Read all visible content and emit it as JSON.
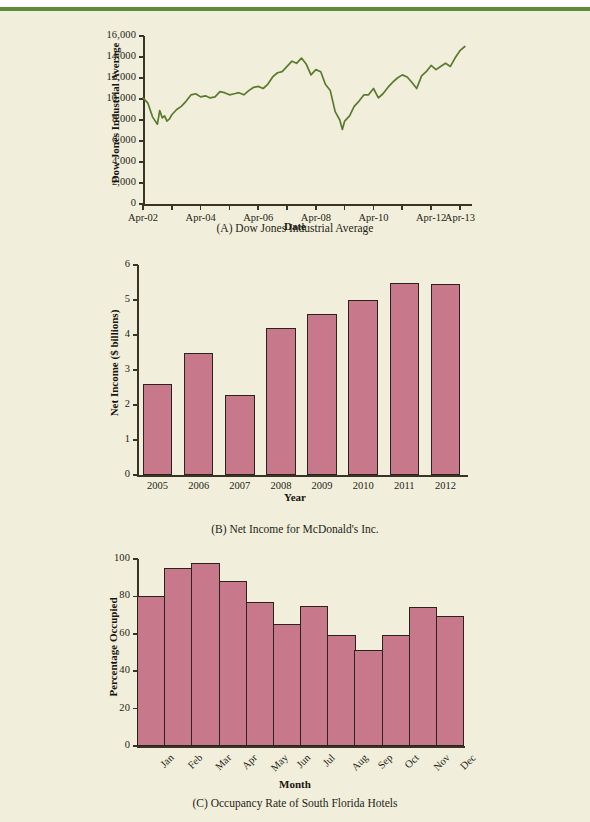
{
  "page": {
    "background_color": "#f1eedb",
    "top_rule_color": "#5d8b3a"
  },
  "charts": [
    {
      "id": "chart-a",
      "caption": "(A) Dow Jones Industrial Average",
      "xlabel": "Date",
      "ylabel": "Dow Jones Industrial Average"
    },
    {
      "id": "chart-b",
      "caption": "(B) Net Income for McDonald's Inc.",
      "xlabel": "Year",
      "ylabel": "Net Income ($ billions)"
    },
    {
      "id": "chart-c",
      "caption": "(C) Occupancy Rate of South Florida Hotels",
      "xlabel": "Month",
      "ylabel": "Percentage Occupied"
    }
  ],
  "chart_data": [
    {
      "type": "line",
      "id": "dow-jones-industrial-average",
      "title": "(A) Dow Jones Industrial Average",
      "xlabel": "Date",
      "ylabel": "Dow Jones Industrial Average",
      "line_color": "#5a7a2e",
      "grid": false,
      "legend": "none",
      "ylim": [
        0,
        16000
      ],
      "ytick_labels": [
        "0",
        "2,000",
        "4,000",
        "6,000",
        "8,000",
        "10,000",
        "12,000",
        "14,000",
        "16,000"
      ],
      "ytick_values": [
        0,
        2000,
        4000,
        6000,
        8000,
        10000,
        12000,
        14000,
        16000
      ],
      "xtick_labels": [
        "Apr-02",
        "Apr-04",
        "Apr-06",
        "Apr-08",
        "Apr-10",
        "Apr-12",
        "Apr-13"
      ],
      "xtick_values": [
        2002.25,
        2004.25,
        2006.25,
        2008.25,
        2010.25,
        2012.25,
        2013.25
      ],
      "xlim": [
        2002.25,
        2013.6
      ],
      "x": [
        2002.25,
        2002.42,
        2002.58,
        2002.75,
        2002.83,
        2002.92,
        2003.0,
        2003.08,
        2003.17,
        2003.25,
        2003.42,
        2003.58,
        2003.75,
        2003.92,
        2004.08,
        2004.25,
        2004.42,
        2004.58,
        2004.75,
        2004.92,
        2005.08,
        2005.25,
        2005.42,
        2005.58,
        2005.75,
        2005.92,
        2006.08,
        2006.25,
        2006.42,
        2006.58,
        2006.75,
        2006.92,
        2007.08,
        2007.25,
        2007.42,
        2007.58,
        2007.75,
        2007.92,
        2008.08,
        2008.25,
        2008.42,
        2008.58,
        2008.75,
        2008.92,
        2009.08,
        2009.17,
        2009.25,
        2009.42,
        2009.58,
        2009.75,
        2009.92,
        2010.08,
        2010.25,
        2010.42,
        2010.58,
        2010.75,
        2010.92,
        2011.08,
        2011.25,
        2011.42,
        2011.58,
        2011.75,
        2011.92,
        2012.08,
        2012.25,
        2012.42,
        2012.58,
        2012.75,
        2012.92,
        2013.08,
        2013.25,
        2013.42
      ],
      "y": [
        10100,
        9600,
        8300,
        7600,
        8900,
        8200,
        8400,
        7900,
        8100,
        8500,
        9000,
        9300,
        9800,
        10400,
        10500,
        10200,
        10300,
        10100,
        10200,
        10700,
        10600,
        10400,
        10500,
        10600,
        10400,
        10800,
        11100,
        11200,
        11000,
        11400,
        12100,
        12500,
        12600,
        13100,
        13600,
        13400,
        13900,
        13300,
        12300,
        12800,
        12600,
        11400,
        10800,
        8800,
        8000,
        7100,
        7900,
        8400,
        9300,
        9800,
        10400,
        10400,
        11000,
        10100,
        10500,
        11100,
        11600,
        12000,
        12300,
        12100,
        11600,
        11000,
        12200,
        12600,
        13200,
        12800,
        13100,
        13400,
        13100,
        13900,
        14600,
        15000
      ]
    },
    {
      "type": "bar",
      "id": "mcdonalds-net-income",
      "title": "(B) Net Income for McDonald's Inc.",
      "xlabel": "Year",
      "ylabel": "Net Income ($ billions)",
      "bar_color": "#c7798b",
      "bar_edge_color": "#2b241d",
      "grid": false,
      "legend": "none",
      "ylim": [
        0,
        6
      ],
      "ytick_labels": [
        "0",
        "1",
        "2",
        "3",
        "4",
        "5",
        "6"
      ],
      "ytick_values": [
        0,
        1,
        2,
        3,
        4,
        5,
        6
      ],
      "categories": [
        "2005",
        "2006",
        "2007",
        "2008",
        "2009",
        "2010",
        "2011",
        "2012"
      ],
      "values": [
        2.6,
        3.5,
        2.3,
        4.2,
        4.6,
        5.0,
        5.5,
        5.45
      ]
    },
    {
      "type": "bar",
      "id": "south-florida-hotel-occupancy",
      "title": "(C) Occupancy Rate of South Florida Hotels",
      "xlabel": "Month",
      "ylabel": "Percentage Occupied",
      "bar_color": "#c7798b",
      "bar_edge_color": "#2b241d",
      "grid": false,
      "legend": "none",
      "ylim": [
        0,
        100
      ],
      "ytick_labels": [
        "0",
        "20",
        "40",
        "60",
        "80",
        "100"
      ],
      "ytick_values": [
        0,
        20,
        40,
        60,
        80,
        100
      ],
      "categories": [
        "Jan",
        "Feb",
        "Mar",
        "Apr",
        "May",
        "Jun",
        "Jul",
        "Aug",
        "Sep",
        "Oct",
        "Nov",
        "Dec"
      ],
      "values": [
        80,
        95,
        98,
        88,
        77,
        65,
        75,
        59.5,
        51.5,
        59.5,
        74.5,
        69.5
      ]
    }
  ]
}
